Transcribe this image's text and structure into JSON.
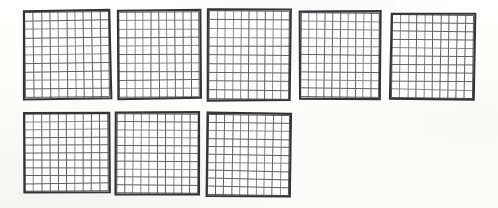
{
  "page": {
    "background_color": "#fdfdfc",
    "width": 498,
    "height": 208
  },
  "colors": {
    "paper": "#fdfdfc",
    "grid_line": "#59585a",
    "grid_line_light": "#6d6c6e",
    "border": "#343336",
    "cell_fill": "#fefefe"
  },
  "grid_spec": {
    "columns": 10,
    "rows": 10,
    "cells_per_grid": 100,
    "total_grids": 8,
    "total_cells": 800,
    "rows_of_grids": 2
  },
  "rows": [
    {
      "row_name": "top-row",
      "grid_count": 5,
      "grids": [
        {
          "index": 1,
          "x": 23,
          "y": 10,
          "width": 88,
          "height": 89,
          "rotation": -0.55
        },
        {
          "index": 2,
          "x": 117,
          "y": 10,
          "width": 84,
          "height": 89,
          "rotation": -0.35
        },
        {
          "index": 3,
          "x": 207,
          "y": 9,
          "width": 84,
          "height": 92,
          "rotation": 0.45
        },
        {
          "index": 4,
          "x": 299,
          "y": 11,
          "width": 82,
          "height": 88,
          "rotation": 0.55
        },
        {
          "index": 5,
          "x": 390,
          "y": 13,
          "width": 85,
          "height": 87,
          "rotation": 0.75
        }
      ]
    },
    {
      "row_name": "bottom-row",
      "grid_count": 3,
      "grids": [
        {
          "index": 6,
          "x": 23,
          "y": 112,
          "width": 87,
          "height": 81,
          "rotation": -0.35
        },
        {
          "index": 7,
          "x": 115,
          "y": 112,
          "width": 85,
          "height": 83,
          "rotation": 0.35
        },
        {
          "index": 8,
          "x": 206,
          "y": 113,
          "width": 85,
          "height": 84,
          "rotation": 0.85
        }
      ]
    }
  ]
}
